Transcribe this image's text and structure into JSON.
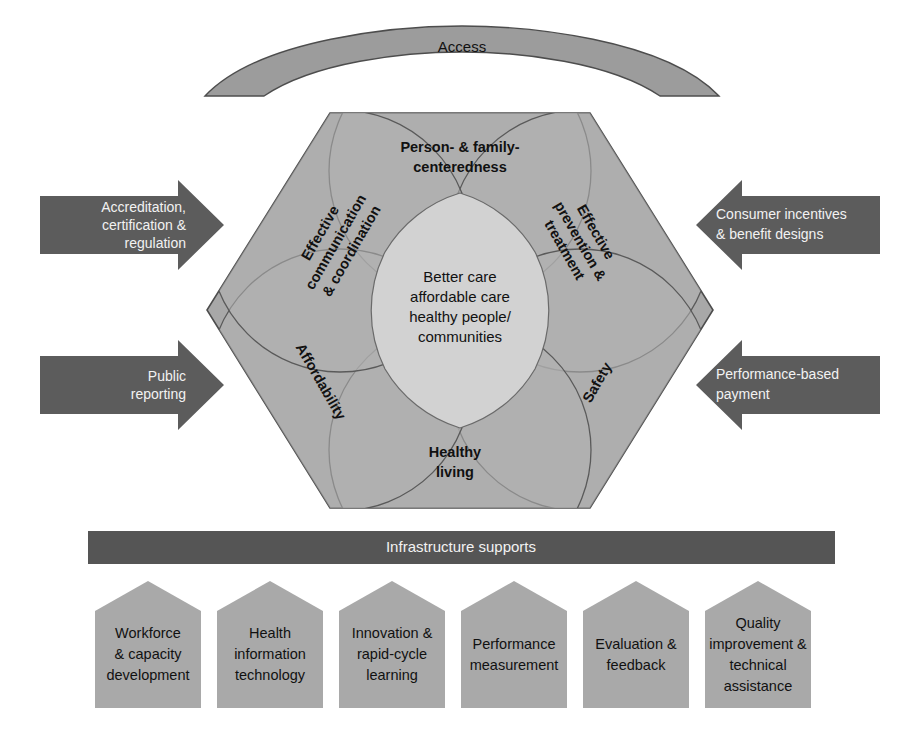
{
  "diagram": {
    "title_hidden": "",
    "colors": {
      "arc_band": "#9a9a9a",
      "hex_outer": "#a6a6a6",
      "hex_inner": "#cfcfcf",
      "petal": "#b0b0b0",
      "arrow_dark": "#5a5a5a",
      "bar_dark": "#555555",
      "support_box": "#a9a9a9",
      "stroke": "#4d4d4d",
      "text_dark": "#111111",
      "text_light": "#f2f2f2"
    },
    "top_band": {
      "label": "Access"
    },
    "hexagon": {
      "center": {
        "lines": [
          "Better care",
          "affordable care",
          "healthy people/",
          "communities"
        ]
      },
      "petals": [
        {
          "id": "person-family-centeredness",
          "lines": [
            "Person- & family-",
            "centeredness"
          ],
          "rotation": 0
        },
        {
          "id": "effective-prevention-treatment",
          "lines": [
            "Effective",
            "prevention &",
            "treatment"
          ],
          "rotation": 60
        },
        {
          "id": "safety",
          "lines": [
            "Safety"
          ],
          "rotation": -60
        },
        {
          "id": "healthy-living",
          "lines": [
            "Healthy",
            "living"
          ],
          "rotation": 0
        },
        {
          "id": "affordability",
          "lines": [
            "Affordability"
          ],
          "rotation": 60
        },
        {
          "id": "effective-communication-coordination",
          "lines": [
            "Effective",
            "communication",
            "& coordination"
          ],
          "rotation": -60
        }
      ]
    },
    "left_arrows": [
      {
        "id": "accreditation",
        "lines": [
          "Accreditation,",
          "certification &",
          "regulation"
        ],
        "direction": "right"
      },
      {
        "id": "public-reporting",
        "lines": [
          "Public",
          "reporting"
        ],
        "direction": "right"
      }
    ],
    "right_arrows": [
      {
        "id": "consumer-incentives",
        "lines": [
          "Consumer incentives",
          "& benefit designs"
        ],
        "direction": "left"
      },
      {
        "id": "performance-based-payment",
        "lines": [
          "Performance-based",
          "payment"
        ],
        "direction": "left"
      }
    ],
    "infrastructure_bar": {
      "label": "Infrastructure supports"
    },
    "supports": [
      {
        "id": "workforce-capacity-development",
        "lines": [
          "Workforce",
          "& capacity",
          "development"
        ]
      },
      {
        "id": "health-information-technology",
        "lines": [
          "Health",
          "information",
          "technology"
        ]
      },
      {
        "id": "innovation-rapid-cycle-learning",
        "lines": [
          "Innovation &",
          "rapid-cycle",
          "learning"
        ]
      },
      {
        "id": "performance-measurement",
        "lines": [
          "Performance",
          "measurement"
        ]
      },
      {
        "id": "evaluation-feedback",
        "lines": [
          "Evaluation &",
          "feedback"
        ]
      },
      {
        "id": "quality-improvement-technical-assistance",
        "lines": [
          "Quality",
          "improvement &",
          "technical",
          "assistance"
        ]
      }
    ]
  }
}
